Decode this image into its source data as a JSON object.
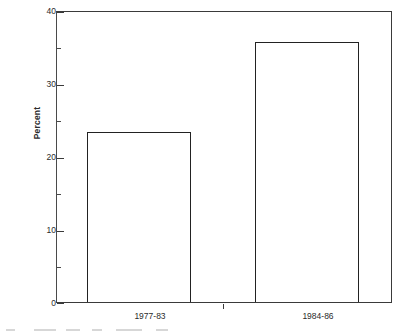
{
  "chart_data": {
    "type": "bar",
    "title": "",
    "subtitle": "",
    "xlabel": "",
    "ylabel": "Percent",
    "categories": [
      "1977-83",
      "1984-86"
    ],
    "values": [
      23.5,
      35.8
    ],
    "series": [
      {
        "name": "Percent",
        "values": [
          23.5,
          35.8
        ]
      }
    ],
    "ylim": [
      0,
      40
    ],
    "y_major_ticks": [
      0,
      10,
      20,
      30,
      40
    ],
    "y_minor_ticks": [
      5,
      15,
      25,
      35
    ],
    "y_tick_labels": [
      "0",
      "10",
      "20",
      "30",
      "40"
    ],
    "grid": false,
    "legend": false,
    "legend_position": "none",
    "bar_style": "hollow-outline",
    "annotations": []
  },
  "axes": {
    "y_title": "Percent",
    "y_labels": [
      {
        "value": 40,
        "text": "40"
      },
      {
        "value": 30,
        "text": "30"
      },
      {
        "value": 20,
        "text": "20"
      },
      {
        "value": 10,
        "text": "10"
      },
      {
        "value": 0,
        "text": "0"
      }
    ],
    "x_labels": [
      {
        "text": "1977-83"
      },
      {
        "text": "1984-86"
      }
    ]
  },
  "colors": {
    "bar_outline": "#222222",
    "bar_fill": "#ffffff",
    "axis": "#3a3a3a",
    "text": "#2b2b2b",
    "background": "#ffffff"
  }
}
